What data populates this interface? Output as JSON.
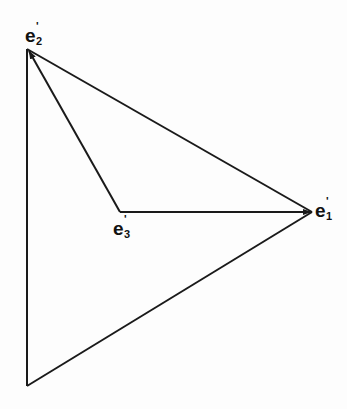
{
  "diagram": {
    "type": "vector triangle diagram",
    "labels": {
      "e1": {
        "base": "e",
        "prime": "'",
        "index": "1"
      },
      "e2": {
        "base": "e",
        "prime": "'",
        "index": "2"
      },
      "e3": {
        "base": "e",
        "prime": "'",
        "index": "3"
      }
    },
    "points": {
      "e2": [
        27,
        49
      ],
      "e1": [
        312,
        212
      ],
      "e3": [
        120,
        212
      ],
      "bottom": [
        27,
        386
      ]
    },
    "edges": [
      {
        "from": "bottom",
        "to": "e2",
        "arrow": false
      },
      {
        "from": "e2",
        "to": "e1",
        "arrow": false
      },
      {
        "from": "e1",
        "to": "bottom",
        "arrow": false
      },
      {
        "from": "e3",
        "to": "e1",
        "arrow": true
      },
      {
        "from": "e3",
        "to": "e2",
        "arrow": true
      }
    ],
    "stroke_color": "#1a1a1a"
  }
}
